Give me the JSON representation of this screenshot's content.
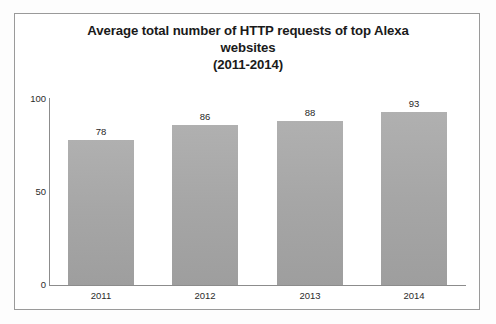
{
  "chart_data": {
    "type": "bar",
    "title": "Average total number of HTTP requests of top Alexa websites (2011-2014)",
    "title_lines": [
      "Average total number of HTTP requests of top Alexa",
      "websites",
      "(2011-2014)"
    ],
    "categories": [
      "2011",
      "2012",
      "2013",
      "2014"
    ],
    "values": [
      78,
      86,
      88,
      93
    ],
    "value_labels": [
      "78",
      "86",
      "88",
      "93"
    ],
    "xlabel": "",
    "ylabel": "",
    "ylim": [
      0,
      100
    ],
    "y_ticks": [
      0,
      50,
      100
    ],
    "y_tick_labels": [
      "0",
      "50",
      "100"
    ],
    "grid": false,
    "legend": false,
    "legend_position": "none",
    "series": [
      {
        "name": "Average total number of HTTP requests",
        "values": [
          78,
          86,
          88,
          93
        ]
      }
    ],
    "colors": {
      "bar_fill": "#a6a6a6",
      "axis": "#8c8c8c",
      "text": "#1f1f1f",
      "frame": "#9a9a9a",
      "background": "#ffffff"
    }
  }
}
